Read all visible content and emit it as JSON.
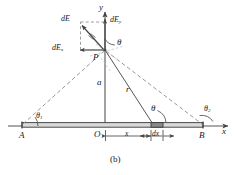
{
  "figure": {
    "caption": "(b)",
    "axes": {
      "y_label": "y",
      "x_label": "x"
    },
    "points": {
      "origin": "O",
      "rod_left_end": "A",
      "rod_right_end": "B",
      "field_point": "P"
    },
    "vectors": {
      "resultant": "dE",
      "x_component": "dE",
      "x_component_sub": "x",
      "y_component": "dE",
      "y_component_sub": "y"
    },
    "lengths": {
      "perpendicular_distance": "a",
      "radial_distance": "r",
      "source_coordinate": "x",
      "differential_element": "dx"
    },
    "angles": {
      "at_point": "θ",
      "at_rod": "θ",
      "at_A": "θ",
      "at_A_sub": "1",
      "at_B": "θ",
      "at_B_sub": "2"
    },
    "colors": {
      "line": "#555555",
      "rod_fill": "#d9d9d9",
      "rod_edge": "#4a4a4a",
      "element_fill": "#8a8a8a",
      "dashed": "#8c8c8c",
      "text": "#1a1a1a"
    }
  }
}
